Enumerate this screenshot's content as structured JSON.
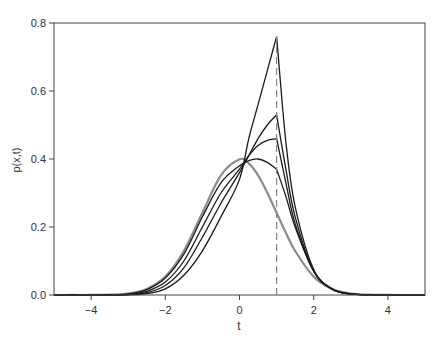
{
  "chart_data": {
    "type": "line",
    "title": "",
    "xlabel": "t",
    "ylabel": "p(x,t)",
    "xlim": [
      -5,
      5
    ],
    "ylim": [
      0,
      0.8
    ],
    "xticks": [
      -4,
      -2,
      0,
      2,
      4
    ],
    "xtick_labels": [
      "-4",
      "-2",
      "0",
      "2",
      "4"
    ],
    "yticks": [
      0.0,
      0.2,
      0.4,
      0.6,
      0.8
    ],
    "ytick_labels": [
      "0.0",
      "0.2",
      "0.4",
      "0.6",
      "0.8"
    ],
    "grid": false,
    "legend": null,
    "annotations": [
      {
        "type": "vertical-dashed-line",
        "x": 1,
        "y_from": 0,
        "y_to": 0.76,
        "color": "#888888"
      }
    ],
    "x": [
      -5,
      -4.5,
      -4,
      -3.5,
      -3,
      -2.5,
      -2,
      -1.5,
      -1,
      -0.5,
      0,
      0.25,
      0.5,
      0.75,
      1,
      1.25,
      1.5,
      2,
      2.5,
      3,
      3.5,
      4,
      4.5,
      5
    ],
    "series": [
      {
        "name": "gray-normal",
        "color": "#8c8c8c",
        "width": 2.2,
        "values": [
          0,
          0.0001,
          0.0001,
          0.0009,
          0.0044,
          0.0175,
          0.054,
          0.1295,
          0.242,
          0.352,
          0.399,
          0.387,
          0.352,
          0.301,
          0.242,
          0.183,
          0.1295,
          0.054,
          0.0175,
          0.0044,
          0.0009,
          0.0001,
          0,
          0
        ]
      },
      {
        "name": "curve-1",
        "color": "#1a1a1a",
        "width": 1.3,
        "values": [
          0,
          0,
          0.0001,
          0.0006,
          0.0035,
          0.016,
          0.05,
          0.12,
          0.23,
          0.33,
          0.38,
          0.395,
          0.4,
          0.39,
          0.37,
          0.29,
          0.2,
          0.07,
          0.018,
          0.003,
          0.0004,
          0,
          0,
          0
        ]
      },
      {
        "name": "curve-2",
        "color": "#1a1a1a",
        "width": 1.3,
        "values": [
          0,
          0,
          0,
          0.0003,
          0.002,
          0.011,
          0.038,
          0.1,
          0.2,
          0.3,
          0.37,
          0.41,
          0.44,
          0.455,
          0.46,
          0.33,
          0.21,
          0.07,
          0.017,
          0.003,
          0.0004,
          0,
          0,
          0
        ]
      },
      {
        "name": "curve-3",
        "color": "#1a1a1a",
        "width": 1.3,
        "values": [
          0,
          0,
          0,
          0.0002,
          0.0012,
          0.007,
          0.028,
          0.08,
          0.17,
          0.27,
          0.36,
          0.41,
          0.46,
          0.5,
          0.53,
          0.37,
          0.23,
          0.07,
          0.017,
          0.003,
          0.0004,
          0,
          0,
          0
        ]
      },
      {
        "name": "curve-4",
        "color": "#1a1a1a",
        "width": 1.3,
        "values": [
          0,
          0,
          0,
          0,
          0.0005,
          0.004,
          0.018,
          0.058,
          0.13,
          0.23,
          0.34,
          0.46,
          0.56,
          0.66,
          0.76,
          0.45,
          0.26,
          0.075,
          0.017,
          0.003,
          0.0004,
          0,
          0,
          0
        ]
      }
    ]
  }
}
